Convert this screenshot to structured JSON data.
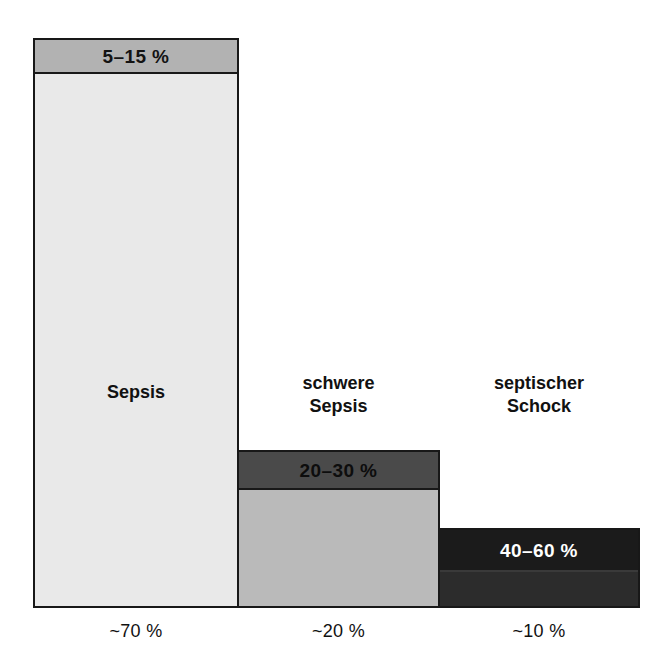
{
  "chart_data": {
    "type": "bar",
    "title": "",
    "subtitle": "",
    "xlabel": "",
    "ylabel": "",
    "grid": false,
    "legend": "none",
    "language": "de",
    "categories": [
      "Sepsis",
      "schwere Sepsis",
      "septischer Schock"
    ],
    "series": [
      {
        "name": "Anteil",
        "role": "bar-width-or-height",
        "values": [
          70,
          20,
          10
        ],
        "value_labels": [
          "~70 %",
          "~20 %",
          "~10 %"
        ],
        "unit": "%"
      },
      {
        "name": "Letalitaet",
        "role": "top-band-label",
        "ranges": [
          [
            5,
            15
          ],
          [
            20,
            30
          ],
          [
            40,
            60
          ]
        ],
        "value_labels": [
          "5–15 %",
          "20–30 %",
          "40–60 %"
        ],
        "unit": "%"
      }
    ],
    "colors": {
      "bar1_band": "#b2b2b2",
      "bar1_body": "#e9e9e9",
      "bar2_band": "#4a4a4a",
      "bar2_body": "#bababa",
      "bar3_band": "#1b1b1b",
      "bar3_body": "#2c2c2c",
      "outline": "#181818",
      "text": "#111111",
      "text_inverse": "#ffffff",
      "background": "#ffffff"
    }
  },
  "bars": [
    {
      "id": "sepsis",
      "category": "Sepsis",
      "category_label": "Sepsis",
      "band_label": "5–15 %",
      "share_label": "~70 %"
    },
    {
      "id": "schwere-sepsis",
      "category": "schwere Sepsis",
      "category_label": "schwere\nSepsis",
      "band_label": "20–30 %",
      "share_label": "~20 %"
    },
    {
      "id": "septischer-schock",
      "category": "septischer Schock",
      "category_label": "septischer\nSchock",
      "band_label": "40–60 %",
      "share_label": "~10 %"
    }
  ]
}
